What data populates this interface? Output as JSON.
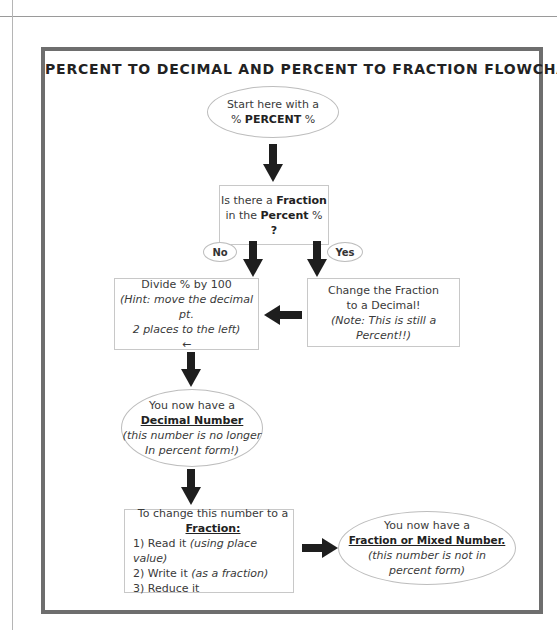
{
  "page": {
    "title": "PERCENT TO DECIMAL AND PERCENT TO FRACTION FLOWCHART"
  },
  "nodes": {
    "start": {
      "line1": "Start here with a",
      "line2_prefix": "% ",
      "line2_bold": "PERCENT",
      "line2_suffix": " %"
    },
    "question": {
      "line1_prefix": "Is there a ",
      "line1_bold": "Fraction",
      "line2_prefix": "in the ",
      "line2_bold": "Percent",
      "line2_suffix": " %",
      "line3": "?"
    },
    "divide": {
      "line1": "Divide % by 100",
      "line2": "(Hint: move the decimal pt.",
      "line3": "2 places to the left)",
      "line4": "←"
    },
    "change_fraction": {
      "line1": "Change the Fraction",
      "line2": "to a Decimal!",
      "line3": "(Note: This is still a Percent!!)"
    },
    "decimal_result": {
      "line1": "You now have a",
      "line2": "Decimal Number",
      "line3": "(this number is no longer",
      "line4": "In percent form!)"
    },
    "to_fraction": {
      "line1": "To change this number to a",
      "line2": "Fraction:",
      "step1_prefix": "1) Read it ",
      "step1_italic": "(using place value)",
      "step2_prefix": "2) Write it ",
      "step2_italic": "(as a fraction)",
      "step3": "3) Reduce it"
    },
    "fraction_result": {
      "line1": "You now have a",
      "line2": "Fraction or Mixed Number.",
      "line3": "(this number is not in",
      "line4": "percent form)"
    }
  },
  "branches": {
    "no_label": "No",
    "yes_label": "Yes"
  },
  "colors": {
    "frame": "#6e6e6e",
    "arrow": "#1e1e1e",
    "node_border": "#c8c8c8"
  }
}
